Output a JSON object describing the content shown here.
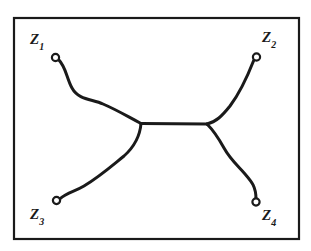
{
  "figure": {
    "background_color": "#ffffff",
    "ink_color": "#1a1a1a",
    "frame": {
      "name": "rectangular-border",
      "x": 14,
      "y": 18,
      "width": 285,
      "height": 221,
      "stroke_width": 2.2
    },
    "labels": {
      "z1": {
        "base": "Z",
        "sub": "1",
        "x": 30,
        "y": 32
      },
      "z2": {
        "base": "Z",
        "sub": "2",
        "x": 262,
        "y": 30
      },
      "z3": {
        "base": "Z",
        "sub": "3",
        "x": 30,
        "y": 207
      },
      "z4": {
        "base": "Z",
        "sub": "4",
        "x": 262,
        "y": 208
      }
    },
    "endpoints": [
      {
        "name": "endpoint-z1",
        "x": 55.5,
        "y": 57.5,
        "r": 3.6
      },
      {
        "name": "endpoint-z2",
        "x": 256.5,
        "y": 57.0,
        "r": 3.6
      },
      {
        "name": "endpoint-z3",
        "x": 56.5,
        "y": 200.5,
        "r": 3.6
      },
      {
        "name": "endpoint-z4",
        "x": 256.0,
        "y": 202.0,
        "r": 3.6
      }
    ],
    "vertices": [
      {
        "name": "junction-left",
        "x": 141,
        "y": 123.5
      },
      {
        "name": "junction-right",
        "x": 207,
        "y": 124.0
      }
    ],
    "edges": [
      {
        "name": "edge-z1-to-left-junction",
        "from": "endpoint-z1",
        "to": "junction-left",
        "path": "M 58.6 59.6 C 66 67 66.5 78 72 88 C 78.5 100 92 99 103 104 C 117 110 125 115 141 123.5"
      },
      {
        "name": "edge-z3-to-left-junction",
        "from": "endpoint-z3",
        "to": "junction-left",
        "path": "M 59.8 198.8 C 68 192 74 192 84 186 C 99 177 108 169 124 156 C 134 147 140 136 141 123.5"
      },
      {
        "name": "edge-internal",
        "from": "junction-left",
        "to": "junction-right",
        "path": "M 141 123.5 L 207 124"
      },
      {
        "name": "edge-z2-to-right-junction",
        "from": "junction-right",
        "to": "endpoint-z2",
        "path": "M 207 124 C 216 122 222 116 230 106 C 239 94 246 80 253.8 60.2"
      },
      {
        "name": "edge-z4-to-right-junction",
        "from": "junction-right",
        "to": "endpoint-z4",
        "path": "M 207 124 C 214 131 219 139 224 148 C 230 159 238 166 245 174 C 251 181 256 186 256 199"
      }
    ]
  }
}
